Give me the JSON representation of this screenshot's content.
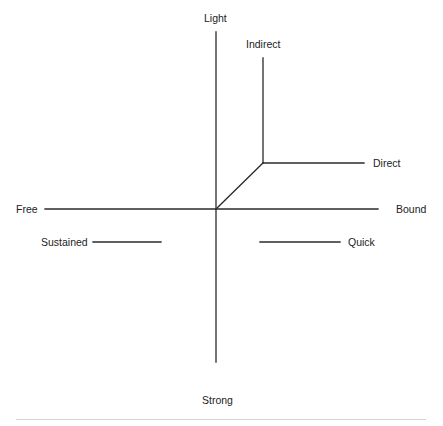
{
  "diagram": {
    "type": "effort-axes",
    "colors": {
      "line": "#2a2a2a",
      "text": "#222222",
      "rule": "#d4d4d4",
      "background": "#ffffff"
    },
    "labels": {
      "light": "Light",
      "strong": "Strong",
      "free": "Free",
      "bound": "Bound",
      "indirect": "Indirect",
      "direct": "Direct",
      "sustained": "Sustained",
      "quick": "Quick"
    },
    "axes": {
      "vertical": {
        "top_label": "Light",
        "bottom_label": "Strong"
      },
      "horizontal": {
        "left_label": "Free",
        "right_label": "Bound"
      }
    },
    "branches": [
      {
        "name": "indirect",
        "label": "Indirect"
      },
      {
        "name": "direct",
        "label": "Direct"
      }
    ],
    "segments": [
      {
        "name": "sustained",
        "label": "Sustained"
      },
      {
        "name": "quick",
        "label": "Quick"
      }
    ]
  }
}
